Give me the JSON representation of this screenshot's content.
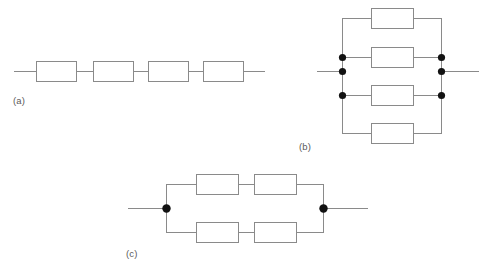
{
  "figure": {
    "background_color": "#ffffff",
    "wire_color": "#8a8a8a",
    "resistor_fill": "#ffffff",
    "resistor_stroke": "#8a8a8a",
    "junction_color": "#121212",
    "label_color": "#5a5a5a"
  },
  "labels": {
    "a": "(a)",
    "b": "(b)",
    "c": "(c)"
  },
  "circuits": {
    "a": {
      "label": "(a)",
      "topology": "series",
      "resistor_count": 4,
      "junction_count": 0,
      "axis_y": 71,
      "lead_left_x": 14,
      "lead_right_x": 265,
      "resistors": [
        {
          "x": 36,
          "y": 61,
          "w": 40,
          "h": 20
        },
        {
          "x": 93,
          "y": 61,
          "w": 40,
          "h": 20
        },
        {
          "x": 148,
          "y": 61,
          "w": 40,
          "h": 20
        },
        {
          "x": 203,
          "y": 61,
          "w": 40,
          "h": 20
        }
      ],
      "label_pos": {
        "x": 13,
        "y": 95
      }
    },
    "b": {
      "label": "(b)",
      "topology": "parallel",
      "resistor_count": 4,
      "junction_count": 6,
      "rail_left_x": 342,
      "rail_right_x": 441,
      "rail_top_y": 18,
      "rail_bottom_y": 133,
      "lead_y": 71,
      "lead_left_x": 317,
      "lead_right_x": 479,
      "branch_ys": [
        18,
        57,
        95,
        133
      ],
      "resistors": [
        {
          "x": 371,
          "y": 8,
          "w": 42,
          "h": 20
        },
        {
          "x": 371,
          "y": 47,
          "w": 42,
          "h": 20
        },
        {
          "x": 371,
          "y": 85,
          "w": 42,
          "h": 20
        },
        {
          "x": 371,
          "y": 123,
          "w": 42,
          "h": 20
        }
      ],
      "junctions": [
        {
          "x": 342,
          "y": 57
        },
        {
          "x": 342,
          "y": 71
        },
        {
          "x": 342,
          "y": 95
        },
        {
          "x": 441,
          "y": 57
        },
        {
          "x": 441,
          "y": 71
        },
        {
          "x": 441,
          "y": 95
        }
      ],
      "label_pos": {
        "x": 299,
        "y": 141
      }
    },
    "c": {
      "label": "(c)",
      "topology": "series-parallel",
      "resistor_count": 4,
      "junction_count": 2,
      "node_left_x": 166,
      "node_right_x": 323,
      "axis_y": 208,
      "lead_left_x": 128,
      "lead_right_x": 368,
      "branch_top_y": 184,
      "branch_bottom_y": 232,
      "resistors": [
        {
          "x": 196,
          "y": 174,
          "w": 42,
          "h": 20
        },
        {
          "x": 254,
          "y": 174,
          "w": 42,
          "h": 20
        },
        {
          "x": 196,
          "y": 222,
          "w": 42,
          "h": 20
        },
        {
          "x": 254,
          "y": 222,
          "w": 42,
          "h": 20
        }
      ],
      "junctions": [
        {
          "x": 166,
          "y": 208
        },
        {
          "x": 323,
          "y": 208
        }
      ],
      "label_pos": {
        "x": 126,
        "y": 248
      }
    }
  }
}
